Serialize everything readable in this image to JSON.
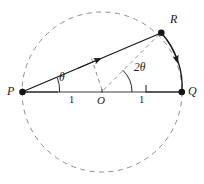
{
  "figure": {
    "canvas": {
      "width": 204,
      "height": 184,
      "background": "#ffffff"
    },
    "colors": {
      "stroke": "#1a1a1a",
      "dashed": "#8c8c8c",
      "chord_gray": "#808080",
      "label": "#1a1a1a"
    },
    "points": [
      {
        "id": "P",
        "label": "P",
        "x": 22,
        "y": 92,
        "dot": true,
        "label_x": 8,
        "label_y": 86
      },
      {
        "id": "Q",
        "label": "Q",
        "x": 182,
        "y": 92,
        "dot": true,
        "label_x": 188,
        "label_y": 86
      },
      {
        "id": "R",
        "label": "R",
        "x": 161,
        "y": 33,
        "dot": true,
        "label_x": 170,
        "label_y": 16
      },
      {
        "id": "O",
        "label": "O",
        "x": 102,
        "y": 92,
        "dot": false,
        "label_x": 98,
        "label_y": 96
      }
    ],
    "angles": [
      {
        "id": "theta-at-P",
        "label": "θ",
        "vertex": "P",
        "label_x": 60,
        "label_y": 74
      },
      {
        "id": "two-theta-at-O",
        "label_number": "2",
        "label_symbol": "θ",
        "vertex": "O",
        "label_x": 134,
        "label_y": 64
      }
    ],
    "lengths": [
      {
        "id": "radius-PO",
        "label": "1",
        "label_x": 71,
        "label_y": 96
      },
      {
        "id": "radius-OQ",
        "label": "1",
        "label_x": 140,
        "label_y": 96
      }
    ],
    "elements": [
      {
        "id": "dashed-circle",
        "kind": "circle",
        "cx": 102,
        "cy": 92,
        "r": 80,
        "style": "dashed"
      },
      {
        "id": "diameter-PQ",
        "kind": "segment",
        "from": "P",
        "to": "Q",
        "style": "solid"
      },
      {
        "id": "chord-PR",
        "kind": "segment",
        "from": "P",
        "to": "R",
        "style": "solid",
        "arrow": "midpoint-toward-R"
      },
      {
        "id": "arc-RQ",
        "kind": "arc",
        "from": "R",
        "to": "Q",
        "style": "solid",
        "arrow": "toward-Q"
      },
      {
        "id": "radius-OR-dashed",
        "kind": "segment",
        "from": "O",
        "to": "R",
        "style": "dashed"
      },
      {
        "id": "helper-O-to-chord-dashed",
        "kind": "segment",
        "from": "O",
        "to": "chord-PR",
        "style": "dashed"
      },
      {
        "id": "arc-theta",
        "kind": "angle-arc",
        "vertex": "P",
        "style": "solid"
      },
      {
        "id": "arc-two-theta",
        "kind": "angle-arc",
        "vertex": "O",
        "style": "solid"
      }
    ]
  }
}
